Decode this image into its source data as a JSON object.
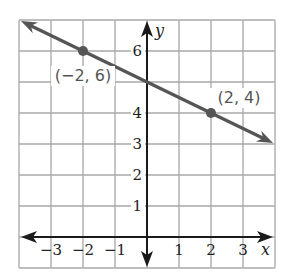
{
  "chart_data": {
    "type": "line",
    "title": "",
    "xlabel": "x",
    "ylabel": "y",
    "xlim": [
      -4,
      4
    ],
    "ylim": [
      -1,
      7
    ],
    "grid": true,
    "x_ticks": [
      -3,
      -2,
      -1,
      1,
      2,
      3
    ],
    "x_tick_labels": [
      "−3",
      "−2",
      "−1",
      "1",
      "2",
      "3"
    ],
    "y_ticks": [
      1,
      2,
      3,
      4,
      6
    ],
    "y_tick_labels": [
      "1",
      "2",
      "3",
      "4",
      "6"
    ],
    "series": [
      {
        "name": "line",
        "equation": "y = -0.5x + 5",
        "slope": -0.5,
        "intercept": 5,
        "x": [
          -4,
          4
        ],
        "y": [
          7,
          3
        ],
        "arrows": "both",
        "color": "#555555"
      }
    ],
    "points": [
      {
        "x": -2,
        "y": 6,
        "label": "(−2, 6)"
      },
      {
        "x": 2,
        "y": 4,
        "label": "(2, 4)"
      }
    ],
    "colors": {
      "grid": "#a8a8a8",
      "axes": "#1a1a1a",
      "line": "#555555"
    }
  }
}
